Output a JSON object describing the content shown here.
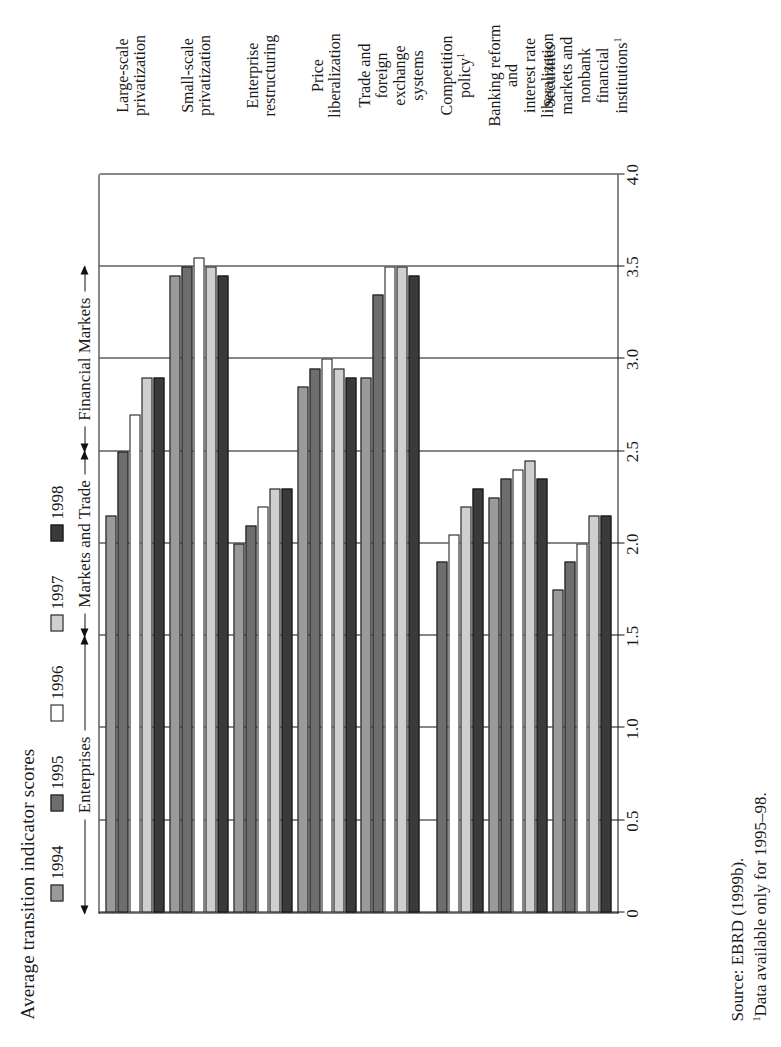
{
  "figure": {
    "title": "Average transition indicator scores"
  },
  "legend": {
    "items": [
      {
        "label": "1994",
        "color": "#9a9a9a"
      },
      {
        "label": "1995",
        "color": "#6e6e6e"
      },
      {
        "label": "1996",
        "color": "#ffffff"
      },
      {
        "label": "1997",
        "color": "#cfcfcf"
      },
      {
        "label": "1998",
        "color": "#3a3a3a"
      }
    ]
  },
  "groups": [
    {
      "label": "Enterprises",
      "start": 0,
      "end": 3
    },
    {
      "label": "Markets and Trade",
      "start": 3,
      "end": 5
    },
    {
      "label": "Financial Markets",
      "start": 5,
      "end": 7
    }
  ],
  "footer": {
    "source": "Source: EBRD (1999b).",
    "note_marker": "1",
    "note": "Data available only for 1995–98."
  },
  "chart_data": {
    "type": "bar",
    "orientation": "horizontal",
    "title": "Average transition indicator scores",
    "xlabel": "",
    "ylabel": "",
    "ylim": [
      0,
      4.0
    ],
    "ticks": [
      "0",
      "0.5",
      "1.0",
      "1.5",
      "2.0",
      "2.5",
      "3.0",
      "3.5",
      "4.0"
    ],
    "tick_values": [
      0,
      0.5,
      1.0,
      1.5,
      2.0,
      2.5,
      3.0,
      3.5,
      4.0
    ],
    "grid": true,
    "legend_position": "top",
    "categories": [
      "Large-scale privatization",
      "Small-scale privatization",
      "Enterprise restructuring",
      "Price liberalization",
      "Trade and foreign exchange systems",
      "Competition policy¹",
      "Banking reform and interest rate liberalization",
      "Securities markets and nonbank financial institutions¹"
    ],
    "category_lines": [
      [
        "Large-scale",
        "privatization"
      ],
      [
        "Small-scale",
        "privatization"
      ],
      [
        "Enterprise",
        "restructuring"
      ],
      [
        "Price",
        "liberalization"
      ],
      [
        "Trade and",
        "foreign",
        "exchange",
        "systems"
      ],
      [
        "Competition",
        "policy¹"
      ],
      [
        "Banking reform",
        "and",
        "interest rate",
        "liberalization"
      ],
      [
        "Securities",
        "markets and",
        "nonbank",
        "financial",
        "institutions¹"
      ]
    ],
    "series": [
      {
        "name": "1994",
        "color": "#9a9a9a",
        "values": [
          2.15,
          3.45,
          2.0,
          2.85,
          2.9,
          null,
          2.25,
          1.75
        ]
      },
      {
        "name": "1995",
        "color": "#6e6e6e",
        "values": [
          2.5,
          3.5,
          2.1,
          2.95,
          3.35,
          1.9,
          2.35,
          1.9
        ]
      },
      {
        "name": "1996",
        "color": "#ffffff",
        "values": [
          2.7,
          3.55,
          2.2,
          3.0,
          3.5,
          2.05,
          2.4,
          2.0
        ]
      },
      {
        "name": "1997",
        "color": "#cfcfcf",
        "values": [
          2.9,
          3.5,
          2.3,
          2.95,
          3.5,
          2.2,
          2.45,
          2.15
        ]
      },
      {
        "name": "1998",
        "color": "#3a3a3a",
        "values": [
          2.9,
          3.45,
          2.3,
          2.9,
          3.45,
          2.3,
          2.35,
          2.15
        ]
      }
    ]
  }
}
